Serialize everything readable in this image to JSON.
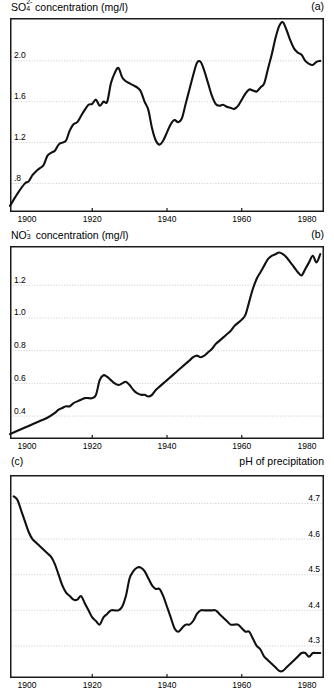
{
  "figure": {
    "background": "#ffffff",
    "line_color": "#111111",
    "grid_color": "#b9b9b9",
    "axis_color": "#1a1a1a"
  },
  "panels": [
    {
      "tag": "(a)",
      "title_prefix": "SO",
      "title_sub": "4",
      "title_sup": "2-",
      "title_rest": " concentration (mg/l)",
      "title_full": "SO4 2- concentration (mg/l)",
      "title_side": "left",
      "tag_side": "right",
      "ylabel_side": "left"
    },
    {
      "tag": "(b)",
      "title_prefix": "NO",
      "title_sub": "3",
      "title_sup": "-",
      "title_rest": " concentration (mg/l)",
      "title_full": "NO3 - concentration (mg/l)",
      "title_side": "left",
      "tag_side": "right",
      "ylabel_side": "left"
    },
    {
      "tag": "(c)",
      "title_prefix": "pH of precipitation",
      "title_sub": "",
      "title_sup": "",
      "title_rest": "",
      "title_full": "pH of precipitation",
      "title_side": "right",
      "tag_side": "left",
      "ylabel_side": "right"
    }
  ],
  "chart_data": [
    {
      "type": "line",
      "panel": "a",
      "title": "SO4 2- concentration (mg/l)",
      "xlabel": "",
      "ylabel": "SO4 2- concentration (mg/l)",
      "xlim": [
        1898,
        1982
      ],
      "ylim": [
        0.52,
        2.42
      ],
      "xticks": [
        1900,
        1920,
        1940,
        1960,
        1980
      ],
      "xticklabels": [
        "1900",
        "1920",
        "1940",
        "1960",
        "1980"
      ],
      "yticks": [
        0.8,
        1.2,
        1.6,
        2.0
      ],
      "yticklabels": [
        ".8",
        "1.2",
        "1.6",
        "2.0"
      ],
      "grid": true,
      "grid_axis": "y",
      "legend": null,
      "x": [
        1898,
        1900,
        1902,
        1903,
        1904,
        1905,
        1906,
        1907,
        1908,
        1909,
        1910,
        1911,
        1912,
        1913,
        1914,
        1915,
        1916,
        1917,
        1918,
        1919,
        1920,
        1921,
        1922,
        1923,
        1924,
        1925,
        1926,
        1927,
        1928,
        1929,
        1930,
        1931,
        1932,
        1933,
        1934,
        1935,
        1936,
        1937,
        1938,
        1939,
        1940,
        1941,
        1942,
        1943,
        1944,
        1945,
        1946,
        1947,
        1948,
        1949,
        1950,
        1951,
        1952,
        1953,
        1954,
        1955,
        1956,
        1957,
        1958,
        1959,
        1960,
        1961,
        1962,
        1963,
        1964,
        1965,
        1966,
        1967,
        1968,
        1969,
        1970,
        1971,
        1972,
        1973,
        1974,
        1975,
        1976,
        1977,
        1978,
        1979,
        1980,
        1981
      ],
      "y": [
        0.58,
        0.7,
        0.8,
        0.82,
        0.88,
        0.92,
        0.95,
        0.98,
        1.07,
        1.1,
        1.12,
        1.18,
        1.2,
        1.22,
        1.32,
        1.38,
        1.4,
        1.46,
        1.52,
        1.57,
        1.58,
        1.62,
        1.56,
        1.6,
        1.6,
        1.78,
        1.88,
        1.93,
        1.84,
        1.8,
        1.78,
        1.76,
        1.74,
        1.7,
        1.6,
        1.52,
        1.34,
        1.22,
        1.18,
        1.22,
        1.3,
        1.38,
        1.42,
        1.4,
        1.44,
        1.58,
        1.72,
        1.86,
        1.98,
        1.99,
        1.9,
        1.78,
        1.66,
        1.58,
        1.56,
        1.57,
        1.55,
        1.54,
        1.53,
        1.56,
        1.62,
        1.68,
        1.72,
        1.71,
        1.7,
        1.74,
        1.78,
        1.92,
        2.06,
        2.22,
        2.34,
        2.38,
        2.3,
        2.2,
        2.12,
        2.08,
        2.06,
        2.0,
        1.97,
        1.96,
        1.99,
        2.0
      ]
    },
    {
      "type": "line",
      "panel": "b",
      "title": "NO3 - concentration (mg/l)",
      "xlabel": "",
      "ylabel": "NO3 - concentration (mg/l)",
      "xlim": [
        1898,
        1982
      ],
      "ylim": [
        0.26,
        1.44
      ],
      "xticks": [
        1900,
        1920,
        1940,
        1960,
        1980
      ],
      "xticklabels": [
        "1900",
        "1920",
        "1940",
        "1960",
        "1980"
      ],
      "yticks": [
        0.4,
        0.6,
        0.8,
        1.0,
        1.2
      ],
      "yticklabels": [
        "0.4",
        "0.6",
        "0.8",
        "1.0",
        "1.2"
      ],
      "grid": true,
      "grid_axis": "y",
      "legend": null,
      "x": [
        1898,
        1900,
        1902,
        1904,
        1906,
        1908,
        1910,
        1911,
        1912,
        1913,
        1914,
        1915,
        1916,
        1917,
        1918,
        1919,
        1920,
        1921,
        1922,
        1923,
        1924,
        1925,
        1926,
        1927,
        1928,
        1929,
        1930,
        1931,
        1932,
        1933,
        1934,
        1935,
        1936,
        1937,
        1938,
        1939,
        1940,
        1941,
        1942,
        1943,
        1944,
        1945,
        1946,
        1947,
        1948,
        1949,
        1950,
        1951,
        1952,
        1953,
        1954,
        1955,
        1956,
        1957,
        1958,
        1959,
        1960,
        1961,
        1962,
        1963,
        1964,
        1965,
        1966,
        1967,
        1968,
        1969,
        1970,
        1971,
        1972,
        1973,
        1974,
        1975,
        1976,
        1977,
        1978,
        1979,
        1980,
        1981
      ],
      "y": [
        0.29,
        0.31,
        0.33,
        0.35,
        0.37,
        0.39,
        0.42,
        0.44,
        0.45,
        0.46,
        0.46,
        0.48,
        0.49,
        0.5,
        0.51,
        0.51,
        0.51,
        0.53,
        0.62,
        0.65,
        0.64,
        0.62,
        0.6,
        0.59,
        0.6,
        0.61,
        0.59,
        0.56,
        0.54,
        0.53,
        0.53,
        0.52,
        0.53,
        0.56,
        0.58,
        0.6,
        0.62,
        0.64,
        0.66,
        0.68,
        0.7,
        0.72,
        0.74,
        0.76,
        0.77,
        0.76,
        0.77,
        0.79,
        0.81,
        0.84,
        0.86,
        0.88,
        0.9,
        0.92,
        0.95,
        0.97,
        0.99,
        1.02,
        1.1,
        1.18,
        1.24,
        1.28,
        1.32,
        1.36,
        1.38,
        1.39,
        1.4,
        1.39,
        1.37,
        1.34,
        1.31,
        1.28,
        1.26,
        1.3,
        1.34,
        1.38,
        1.34,
        1.39
      ]
    },
    {
      "type": "line",
      "panel": "c",
      "title": "pH of precipitation",
      "xlabel": "",
      "ylabel": "pH of precipitation",
      "xlim": [
        1898,
        1982
      ],
      "ylim": [
        4.21,
        4.78
      ],
      "xticks": [
        1900,
        1920,
        1940,
        1960,
        1980
      ],
      "xticklabels": [
        "1900",
        "1920",
        "1940",
        "1960",
        "1980"
      ],
      "yticks": [
        4.3,
        4.4,
        4.5,
        4.6,
        4.7
      ],
      "yticklabels": [
        "4.3",
        "4.4",
        "4.5",
        "4.6",
        "4.7"
      ],
      "grid": true,
      "grid_axis": "y",
      "legend": null,
      "x": [
        1899,
        1900,
        1901,
        1902,
        1903,
        1904,
        1905,
        1906,
        1907,
        1908,
        1909,
        1910,
        1911,
        1912,
        1913,
        1914,
        1915,
        1916,
        1917,
        1918,
        1919,
        1920,
        1921,
        1922,
        1923,
        1924,
        1925,
        1926,
        1927,
        1928,
        1929,
        1930,
        1931,
        1932,
        1933,
        1934,
        1935,
        1936,
        1937,
        1938,
        1939,
        1940,
        1941,
        1942,
        1943,
        1944,
        1945,
        1946,
        1947,
        1948,
        1949,
        1950,
        1951,
        1952,
        1953,
        1954,
        1955,
        1956,
        1957,
        1958,
        1959,
        1960,
        1961,
        1962,
        1963,
        1964,
        1965,
        1966,
        1967,
        1968,
        1969,
        1970,
        1971,
        1972,
        1973,
        1974,
        1975,
        1976,
        1977,
        1978,
        1979,
        1980,
        1981
      ],
      "y": [
        4.72,
        4.71,
        4.68,
        4.65,
        4.62,
        4.6,
        4.59,
        4.58,
        4.57,
        4.56,
        4.55,
        4.53,
        4.5,
        4.47,
        4.45,
        4.44,
        4.43,
        4.43,
        4.44,
        4.42,
        4.4,
        4.38,
        4.37,
        4.36,
        4.38,
        4.39,
        4.4,
        4.4,
        4.4,
        4.41,
        4.44,
        4.49,
        4.51,
        4.52,
        4.52,
        4.51,
        4.49,
        4.47,
        4.46,
        4.46,
        4.44,
        4.41,
        4.38,
        4.35,
        4.34,
        4.35,
        4.36,
        4.36,
        4.37,
        4.39,
        4.4,
        4.4,
        4.4,
        4.4,
        4.4,
        4.39,
        4.38,
        4.37,
        4.36,
        4.36,
        4.36,
        4.35,
        4.34,
        4.34,
        4.32,
        4.3,
        4.29,
        4.27,
        4.26,
        4.25,
        4.24,
        4.23,
        4.23,
        4.24,
        4.25,
        4.26,
        4.27,
        4.28,
        4.28,
        4.27,
        4.28,
        4.28,
        4.28
      ]
    }
  ]
}
